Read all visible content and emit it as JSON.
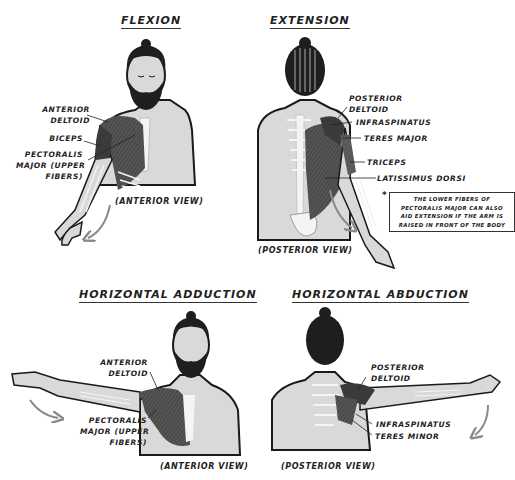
{
  "panels": [
    {
      "title": "FLEXION",
      "view": "(ANTERIOR VIEW)",
      "labels": [
        "ANTERIOR",
        "DELTOID",
        "BICEPS",
        "PECTORALIS",
        "MAJOR (UPPER",
        "FIBERS)"
      ]
    },
    {
      "title": "EXTENSION",
      "view": "(POSTERIOR VIEW)",
      "labels": [
        "POSTERIOR",
        "DELTOID",
        "INFRASPINATUS",
        "TERES MAJOR",
        "TRICEPS",
        "LATISSIMUS DORSI"
      ],
      "note": {
        "marker": "*",
        "lines": [
          "THE LOWER FIBERS OF",
          "PECTORALIS MAJOR CAN ALSO",
          "AID EXTENSION IF THE ARM IS",
          "RAISED IN FRONT OF THE BODY"
        ]
      }
    },
    {
      "title": "HORIZONTAL ADDUCTION",
      "view": "(ANTERIOR VIEW)",
      "labels": [
        "ANTERIOR",
        "DELTOID",
        "PECTORALIS",
        "MAJOR (UPPER",
        "FIBERS)"
      ]
    },
    {
      "title": "HORIZONTAL ABDUCTION",
      "view": "(POSTERIOR VIEW)",
      "labels": [
        "POSTERIOR",
        "DELTOID",
        "INFRASPINATUS",
        "TERES MINOR"
      ]
    }
  ],
  "colors": {
    "skin": "#d9d9d9",
    "muscle": "#5a5a5a",
    "muscle_dark": "#3a3a3a",
    "hair": "#1e1e1e",
    "outline": "#1a1a1a",
    "bone": "#f4f4f4",
    "arrow": "#8a8a8a"
  }
}
